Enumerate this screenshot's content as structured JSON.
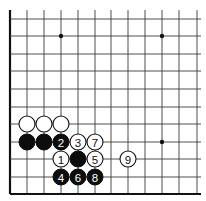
{
  "board": {
    "width": 206,
    "height": 201,
    "columns_x": [
      10,
      27,
      44,
      61,
      78,
      95,
      111,
      128,
      145,
      162,
      179,
      197
    ],
    "rows_y_from_bottom": [
      194,
      177,
      159,
      142,
      124,
      107,
      89,
      71,
      54,
      36,
      19
    ],
    "top_extent_y": 10,
    "right_extent_x": 201,
    "left_edge": true,
    "bottom_edge": true,
    "stone_radius": 8,
    "colors": {
      "black": "#0d0d0d",
      "white": "#ffffff",
      "line": "#3a3a3a"
    }
  },
  "star_points": [
    {
      "col": 3,
      "row": 9
    },
    {
      "col": 9,
      "row": 9
    },
    {
      "col": 9,
      "row": 3
    }
  ],
  "stones": [
    {
      "color": "white",
      "col": 1,
      "row": 4,
      "label": ""
    },
    {
      "color": "white",
      "col": 2,
      "row": 4,
      "label": ""
    },
    {
      "color": "white",
      "col": 3,
      "row": 4,
      "label": ""
    },
    {
      "color": "black",
      "col": 1,
      "row": 3,
      "label": ""
    },
    {
      "color": "black",
      "col": 2,
      "row": 3,
      "label": ""
    },
    {
      "color": "black",
      "col": 3,
      "row": 3,
      "label": "2"
    },
    {
      "color": "white",
      "col": 4,
      "row": 3,
      "label": "3"
    },
    {
      "color": "white",
      "col": 5,
      "row": 3,
      "label": "7"
    },
    {
      "color": "white",
      "col": 3,
      "row": 2,
      "label": "1"
    },
    {
      "color": "black",
      "col": 4,
      "row": 2,
      "label": ""
    },
    {
      "color": "white",
      "col": 5,
      "row": 2,
      "label": "5"
    },
    {
      "color": "white",
      "col": 7,
      "row": 2,
      "label": "9"
    },
    {
      "color": "black",
      "col": 3,
      "row": 1,
      "label": "4"
    },
    {
      "color": "black",
      "col": 4,
      "row": 1,
      "label": "6"
    },
    {
      "color": "black",
      "col": 5,
      "row": 1,
      "label": "8"
    }
  ]
}
